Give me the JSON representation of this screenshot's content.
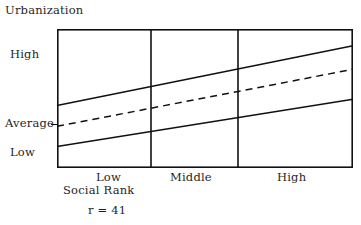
{
  "chart_data": {
    "type": "line",
    "title": "",
    "ylabel": "Urbanization",
    "xlabel": "Social Rank",
    "categories": [
      "Low",
      "Middle",
      "High"
    ],
    "ytick_labels": [
      "High",
      "Average",
      "Low"
    ],
    "ytick_values": [
      0.72,
      0.3,
      0.09
    ],
    "ylim": [
      0,
      1
    ],
    "xlim": [
      0,
      3
    ],
    "grid": false,
    "legend": "none",
    "panel_dividers": [
      1,
      2
    ],
    "annotations": [
      {
        "name": "correlation",
        "text": "r = 41"
      }
    ],
    "series": [
      {
        "name": "upper-band",
        "style": "solid",
        "x": [
          0,
          3
        ],
        "values": [
          0.45,
          0.88
        ]
      },
      {
        "name": "mean-trend",
        "style": "dashed",
        "x": [
          0,
          3
        ],
        "values": [
          0.3,
          0.71
        ]
      },
      {
        "name": "lower-band",
        "style": "solid",
        "x": [
          0,
          3
        ],
        "values": [
          0.155,
          0.495
        ]
      }
    ]
  },
  "figure": {
    "y_axis_title": "Urbanization",
    "x_axis_title": "Social Rank",
    "y_ticks": [
      {
        "label": "High"
      },
      {
        "label": "Average"
      },
      {
        "label": "Low"
      }
    ],
    "x_ticks": [
      {
        "label": "Low"
      },
      {
        "label": "Middle"
      },
      {
        "label": "High"
      }
    ],
    "correlation_note": "r = 41",
    "colors": {
      "line": "#111111",
      "frame": "#111111",
      "background": "#ffffff",
      "text": "#1f1f1f"
    }
  }
}
